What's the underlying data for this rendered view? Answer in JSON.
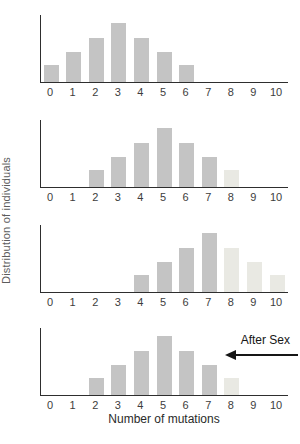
{
  "figure": {
    "background": "#ffffff"
  },
  "chart_data": {
    "type": "bar",
    "title": "",
    "xlabel": "Number of mutations",
    "ylabel": "Distribution of individuals",
    "categories": [
      0,
      1,
      2,
      3,
      4,
      5,
      6,
      7,
      8,
      9,
      10
    ],
    "ylim": [
      0,
      3.9
    ],
    "grid": false,
    "legend": "none",
    "colors": {
      "bar_dark": "#c4c4c4",
      "bar_light": "#e9e9e3",
      "axis": "#2e2e2e",
      "tick_text": "#3d3d3d",
      "annotation_text": "#161616"
    },
    "panels": [
      {
        "name": "before-selection-generation-1",
        "values": [
          1,
          1.8,
          2.6,
          3.5,
          2.6,
          1.8,
          1,
          0,
          0,
          0,
          0
        ],
        "light_bars": []
      },
      {
        "name": "generation-2",
        "values": [
          0,
          0,
          1,
          1.8,
          2.6,
          3.5,
          2.6,
          1.8,
          1,
          0,
          0
        ],
        "light_bars": [
          8
        ]
      },
      {
        "name": "generation-3",
        "values": [
          0,
          0,
          0,
          0,
          1,
          1.8,
          2.6,
          3.5,
          2.6,
          1.8,
          1
        ],
        "light_bars": [
          8,
          9,
          10
        ]
      },
      {
        "name": "after-sex",
        "values": [
          0,
          0,
          1,
          1.8,
          2.6,
          3.5,
          2.6,
          1.8,
          1,
          0,
          0
        ],
        "light_bars": [
          8
        ],
        "annotation": "After Sex"
      }
    ],
    "layout": {
      "panel_tops_px": [
        15,
        120,
        225,
        328
      ],
      "plot_height_px": 67,
      "tick_spacing_px": 22.6,
      "first_tick_offset_px": 10,
      "bar_width_px": 15,
      "max_bar_height_px": 59
    }
  }
}
